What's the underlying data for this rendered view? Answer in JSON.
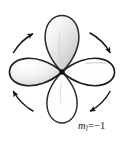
{
  "figure": {
    "background_color": "#ffffff",
    "width": 123,
    "height": 142,
    "label": {
      "variable": "m",
      "subscript": "l",
      "equals": "=−1",
      "full_text": "mₗ=−1",
      "value": -1
    },
    "nucleus": {
      "name": "nucleus-dot",
      "color": "#111111",
      "cx": 62,
      "cy": 72,
      "r": 2.6
    },
    "lobes": [
      {
        "id": "top",
        "name": "orbital-lobe-top",
        "orientation": "up",
        "fill_style": "shaded",
        "fill_light": "#f2f2f2",
        "fill_dark": "#b9b9b9",
        "stroke": "#2b2b2b",
        "stroke_width": 1.5
      },
      {
        "id": "left",
        "name": "orbital-lobe-left",
        "orientation": "left",
        "fill_style": "shaded",
        "fill_light": "#fbfbfb",
        "fill_dark": "#c2c2c2",
        "stroke": "#1f1f1f",
        "stroke_width": 1.7
      },
      {
        "id": "right",
        "name": "orbital-lobe-right",
        "orientation": "right",
        "fill_style": "white",
        "fill_light": "#ffffff",
        "fill_dark": "#ffffff",
        "stroke": "#1f1f1f",
        "stroke_width": 1.7
      },
      {
        "id": "bottom",
        "name": "orbital-lobe-bottom",
        "orientation": "down",
        "fill_style": "white",
        "fill_light": "#ffffff",
        "fill_dark": "#ffffff",
        "stroke": "#2b2b2b",
        "stroke_width": 1.5
      }
    ],
    "arrows": [
      {
        "id": "top-left",
        "name": "rotation-arrow-top-left",
        "direction": "up-right",
        "color": "#111111"
      },
      {
        "id": "top-right",
        "name": "rotation-arrow-top-right",
        "direction": "down-right",
        "color": "#111111"
      },
      {
        "id": "bottom-right",
        "name": "rotation-arrow-bottom-right",
        "direction": "down-left",
        "color": "#111111"
      },
      {
        "id": "bottom-left",
        "name": "rotation-arrow-bottom-left",
        "direction": "up-left",
        "color": "#111111"
      }
    ],
    "rotation_sense": "clockwise"
  }
}
